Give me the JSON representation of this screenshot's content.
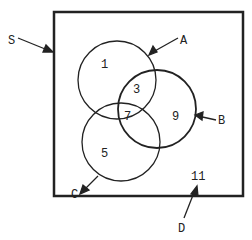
{
  "diagram": {
    "type": "venn",
    "universe_label": "S",
    "sets": [
      {
        "name": "A",
        "label": "A"
      },
      {
        "name": "B",
        "label": "B"
      },
      {
        "name": "C",
        "label": "C"
      }
    ],
    "outside_label": "D",
    "regions": {
      "A_only": "1",
      "A_and_B": "3",
      "A_B_C": "7",
      "B_only": "9",
      "C_only": "5",
      "outside": "11"
    },
    "colors": {
      "stroke": "#222222",
      "background": "#ffffff"
    }
  }
}
